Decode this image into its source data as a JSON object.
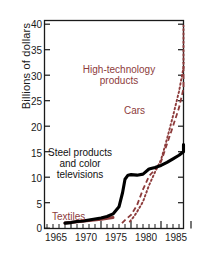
{
  "chart_data": {
    "type": "line",
    "title": "",
    "subtitle": "",
    "xlabel": "",
    "ylabel": "Billions of dollars",
    "xlim": [
      1963,
      1986.5
    ],
    "ylim": [
      0,
      42
    ],
    "xticks": [
      1965,
      1970,
      1975,
      1980,
      1985
    ],
    "xtick_labels": [
      "1965",
      "1970",
      "1975",
      "1980",
      "1985"
    ],
    "yticks": [
      0,
      5,
      10,
      15,
      20,
      25,
      30,
      35,
      40
    ],
    "ytick_labels": [
      "0",
      "5",
      "10",
      "15",
      "20",
      "25",
      "30",
      "35",
      "40"
    ],
    "minor_xticks_between": 4,
    "grid": false,
    "legend": "inline-annotations",
    "series": [
      {
        "name": "Steel products and color televisions",
        "style": "solid-thick",
        "color": "#000000",
        "x": [
          1964,
          1965,
          1966,
          1967,
          1968,
          1969,
          1970,
          1971,
          1972,
          1973,
          1973.6,
          1974,
          1974.5,
          1975,
          1976,
          1977,
          1978,
          1979,
          1980,
          1981,
          1982,
          1983,
          1984,
          1985,
          1985.8
        ],
        "y": [
          1.0,
          1.1,
          1.3,
          1.4,
          1.6,
          1.8,
          2.0,
          2.3,
          2.8,
          4.2,
          7.0,
          9.6,
          10.4,
          10.5,
          10.4,
          10.6,
          11.6,
          11.9,
          12.3,
          12.9,
          13.6,
          14.3,
          15.0,
          15.8,
          16.4
        ]
      },
      {
        "name": "Cars",
        "style": "dashed",
        "color": "#8d3b3b",
        "x": [
          1973.5,
          1974,
          1975,
          1976,
          1977,
          1978,
          1979,
          1980,
          1981,
          1982,
          1983,
          1984,
          1985,
          1985.6
        ],
        "y": [
          1.0,
          1.6,
          2.6,
          4.5,
          7.6,
          10.2,
          11.5,
          13.0,
          16.5,
          20.0,
          23.6,
          27.4,
          30.8,
          32.6
        ]
      },
      {
        "name": "High-technology products",
        "style": "dotted",
        "color": "#8d3b3b",
        "x": [
          1974.8,
          1975.5,
          1976,
          1977,
          1978,
          1979,
          1980,
          1981,
          1982,
          1983,
          1984,
          1985,
          1985.4
        ],
        "y": [
          1.3,
          2.3,
          3.2,
          5.2,
          8.4,
          11.0,
          13.4,
          17.5,
          22.0,
          26.8,
          31.5,
          37.5,
          39.7
        ]
      },
      {
        "name": "Textiles",
        "style": "solid-thick",
        "color": "#8d3b3b",
        "x": [
          1964,
          1966,
          1968,
          1970,
          1972
        ],
        "y": [
          1.0,
          1.25,
          1.5,
          1.75,
          2.1
        ]
      }
    ],
    "annotations": [
      {
        "name": "high-technology-products",
        "text_line1": "High-technology",
        "text_line2": "products",
        "color": "#8d3b3b"
      },
      {
        "name": "cars",
        "text_line1": "Cars",
        "text_line2": "",
        "color": "#8d3b3b"
      },
      {
        "name": "steel-products",
        "text_line1": "Steel products",
        "text_line2": "and color",
        "text_line3": "televisions",
        "color": "#111111"
      },
      {
        "name": "textiles",
        "text_line1": "Textiles",
        "text_line2": "",
        "color": "#8d3b3b"
      }
    ],
    "colors": {
      "axis": "#1a1a1a",
      "red": "#8d3b3b",
      "black": "#000000",
      "background": "#ffffff"
    }
  }
}
